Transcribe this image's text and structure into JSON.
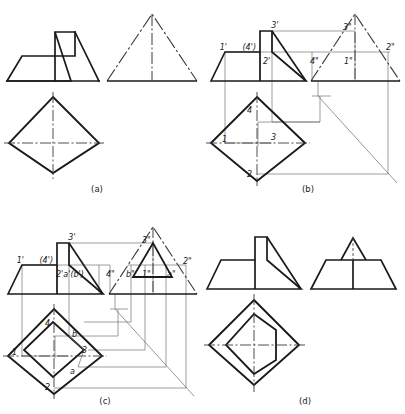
{
  "figure": {
    "background_color": "#ffffff",
    "line_color": "#1a1a1a",
    "thin_line_color": "#4a4a4a",
    "panels": [
      {
        "id": "a",
        "caption": "(a)",
        "description": "Three views: front view with notched profile, side view triangle with dash-dot slant edges, top view diamond with centerlines",
        "labels": []
      },
      {
        "id": "b",
        "caption": "(b)",
        "description": "Front, side and top views with projection lines and numbered points 1-4 on each view",
        "labels": [
          "3'",
          "1'",
          "(4')",
          "2'",
          "3\"",
          "4\"",
          "1\"",
          "2\"",
          "4",
          "1",
          "3",
          "2"
        ]
      },
      {
        "id": "c",
        "caption": "(c)",
        "description": "Front, side and top views with additional auxiliary points a and b plus inner diamond in the top view",
        "labels": [
          "3'",
          "1'",
          "(4')",
          "2'a'(b')",
          "3\"",
          "4\"",
          "b\"",
          "1\"",
          "a\"",
          "2\"",
          "4",
          "1",
          "3",
          "2",
          "a",
          "b"
        ]
      },
      {
        "id": "d",
        "caption": "(d)",
        "description": "Final three views: front view notched profile, side view trapezoid with small triangle, top view diamond with inner hexagonal outline",
        "labels": []
      }
    ]
  },
  "captions": {
    "a": "(a)",
    "b": "(b)",
    "c": "(c)",
    "d": "(d)"
  },
  "panel_b_labels": {
    "p3f": "3'",
    "p1f": "1'",
    "p4f": "(4')",
    "p2f": "2'",
    "p3s": "3\"",
    "p4s": "4\"",
    "p1s": "1\"",
    "p2s": "2\"",
    "t4": "4",
    "t1": "1",
    "t3": "3",
    "t2": "2"
  },
  "panel_c_labels": {
    "p3f": "3'",
    "p1f": "1'",
    "p4f": "(4')",
    "p2ab": "2'a'(b')",
    "p3s": "3\"",
    "p4s": "4\"",
    "pbs": "b\"",
    "p1s": "1\"",
    "pas": "a\"",
    "p2s": "2\"",
    "t4": "4",
    "t1": "1",
    "t3": "3",
    "t2": "2",
    "ta": "a",
    "tb": "b"
  }
}
